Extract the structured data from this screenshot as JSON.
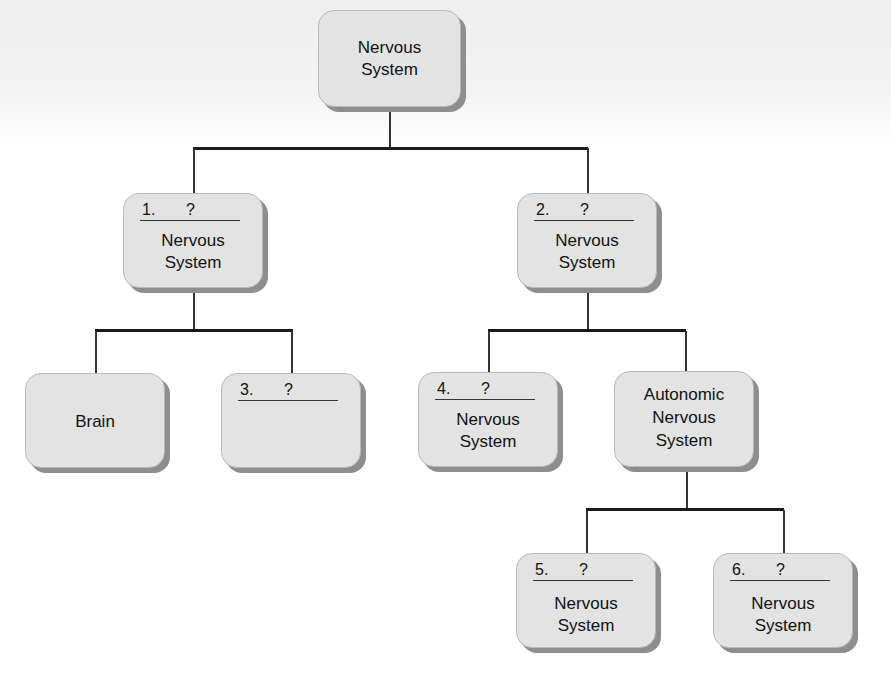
{
  "diagram": {
    "root": {
      "label_line1": "Nervous",
      "label_line2": "System"
    },
    "node1": {
      "number": "1.",
      "question": "?",
      "label_line1": "Nervous",
      "label_line2": "System"
    },
    "node2": {
      "number": "2.",
      "question": "?",
      "label_line1": "Nervous",
      "label_line2": "System"
    },
    "brain": {
      "label": "Brain"
    },
    "node3": {
      "number": "3.",
      "question": "?"
    },
    "node4": {
      "number": "4.",
      "question": "?",
      "label_line1": "Nervous",
      "label_line2": "System"
    },
    "autonomic": {
      "label_line1": "Autonomic",
      "label_line2": "Nervous",
      "label_line3": "System"
    },
    "node5": {
      "number": "5.",
      "question": "?",
      "label_line1": "Nervous",
      "label_line2": "System"
    },
    "node6": {
      "number": "6.",
      "question": "?",
      "label_line1": "Nervous",
      "label_line2": "System"
    }
  },
  "colors": {
    "box_fill": "#e3e3e3",
    "box_shadow": "#8e8e8e",
    "connector": "#1a1a1a"
  }
}
